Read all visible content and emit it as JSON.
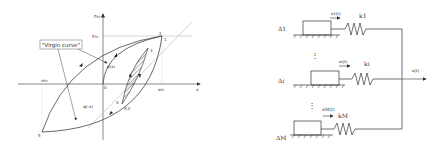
{
  "hysteresis": {
    "y_axis_label": "Fm",
    "y_tick": "Fm",
    "x_axis_label": "x",
    "x_tick_pos": "xm",
    "x_tick_neg": "-xm",
    "origin_label": "0",
    "virgin_curve_label": "\"Virgin curve\"",
    "phi_x_label": "φ(x)",
    "phi_neg_x_label": "-φ(-x)",
    "point_labels": {
      "p1": "1",
      "p2_top": "2",
      "p3": "3",
      "p4": "4",
      "p42": "4,2",
      "p5": "5"
    }
  },
  "spring_model": {
    "elements": [
      {
        "delta": "Δ1",
        "x": "x1(t)",
        "k": "k1"
      },
      {
        "delta": "Δi",
        "x": "xi(t)",
        "k": "ki"
      },
      {
        "delta": "ΔM",
        "x": "xM(t)",
        "k": "kM"
      }
    ],
    "output": "x(t)",
    "ellipsis": "⋮"
  }
}
